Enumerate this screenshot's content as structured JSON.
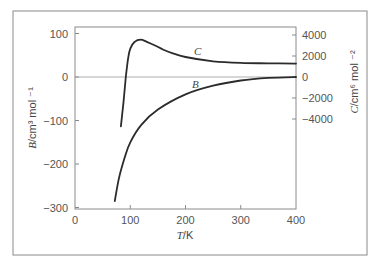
{
  "chart_data": {
    "type": "line",
    "title": "",
    "xlabel": "T/K",
    "ylabel_left": "B/cm³ mol⁻¹",
    "ylabel_right": "C/cm⁶ mol⁻²",
    "xlim": [
      0,
      400
    ],
    "ylim_left": [
      -300,
      116
    ],
    "ylim_right": [
      -4800,
      3800
    ],
    "x_ticks": [
      0,
      100,
      200,
      300,
      400
    ],
    "y_ticks_left": [
      100,
      0,
      -100,
      -200,
      -300
    ],
    "y_ticks_right": [
      4000,
      2000,
      0,
      -2000,
      -4000
    ],
    "grid": false,
    "zero_line": true,
    "series": [
      {
        "name": "B",
        "axis": "left",
        "x": [
          72,
          80,
          90,
          100,
          120,
          150,
          200,
          250,
          300,
          350,
          400
        ],
        "values": [
          -285,
          -230,
          -185,
          -150,
          -110,
          -75,
          -40,
          -20,
          -8,
          -2,
          0
        ]
      },
      {
        "name": "C",
        "axis": "right",
        "x": [
          83,
          88,
          92,
          96,
          100,
          108,
          119,
          130,
          145,
          160,
          180,
          200,
          250,
          300,
          350,
          400
        ],
        "values": [
          -4700,
          -2300,
          0,
          1700,
          2700,
          3350,
          3550,
          3350,
          3000,
          2600,
          2200,
          1900,
          1500,
          1350,
          1300,
          1280
        ]
      }
    ],
    "annotations": [
      {
        "text": "C",
        "x": 220,
        "series": "C"
      },
      {
        "text": "B",
        "x": 215,
        "series": "B"
      }
    ]
  },
  "labels": {
    "x_axis": "T/K",
    "x_axis_italic": "T",
    "x_axis_unit": "/K",
    "y_left_italic": "B",
    "y_left_unit": "/cm³ mol ⁻¹",
    "y_right_italic": "C",
    "y_right_unit": "/cm⁶ mol ⁻²",
    "curve_b": "B",
    "curve_c": "C"
  }
}
